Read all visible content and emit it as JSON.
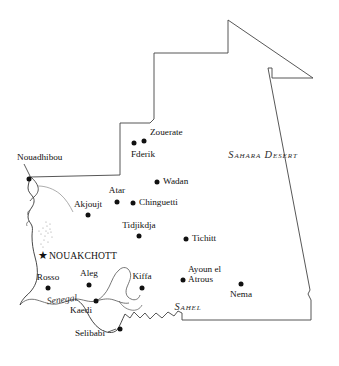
{
  "map": {
    "title": "Mauritania",
    "colors": {
      "border": "#444444",
      "coast": "#333333",
      "river": "#555555",
      "marker": "#111111",
      "background": "#ffffff"
    },
    "capital": {
      "name": "NOUAKCHOTT",
      "marker": "star-marker",
      "marker_glyph": "★",
      "dot_x": 43,
      "dot_y": 255,
      "label_x": 49,
      "label_y": 255
    },
    "cities": [
      {
        "name": "Zouerate",
        "dot_x": 144,
        "dot_y": 141,
        "label_x": 150,
        "label_y": 133,
        "anchor": "anchor-left"
      },
      {
        "name": "Fderik",
        "dot_x": 134,
        "dot_y": 143,
        "label_x": 131,
        "label_y": 155,
        "anchor": "anchor-left"
      },
      {
        "name": "Wadan",
        "dot_x": 157,
        "dot_y": 182,
        "label_x": 163,
        "label_y": 182,
        "anchor": "anchor-left"
      },
      {
        "name": "Atar",
        "dot_x": 117,
        "dot_y": 202,
        "label_x": 117,
        "label_y": 191,
        "anchor": "anchor-mid"
      },
      {
        "name": "Chinguetti",
        "dot_x": 133,
        "dot_y": 203,
        "label_x": 139,
        "label_y": 203,
        "anchor": "anchor-left"
      },
      {
        "name": "Akjoujt",
        "dot_x": 88,
        "dot_y": 215,
        "label_x": 88,
        "label_y": 205,
        "anchor": "anchor-mid"
      },
      {
        "name": "Tidjikdja",
        "dot_x": 139,
        "dot_y": 236,
        "label_x": 139,
        "label_y": 226,
        "anchor": "anchor-mid"
      },
      {
        "name": "Tichitt",
        "dot_x": 186,
        "dot_y": 239,
        "label_x": 192,
        "label_y": 239,
        "anchor": "anchor-left"
      },
      {
        "name": "Rosso",
        "dot_x": 48,
        "dot_y": 288,
        "label_x": 48,
        "label_y": 278,
        "anchor": "anchor-mid"
      },
      {
        "name": "Aleg",
        "dot_x": 89,
        "dot_y": 285,
        "label_x": 89,
        "label_y": 274,
        "anchor": "anchor-mid"
      },
      {
        "name": "Kiffa",
        "dot_x": 142,
        "dot_y": 288,
        "label_x": 142,
        "label_y": 277,
        "anchor": "anchor-mid"
      },
      {
        "name": "Nema",
        "dot_x": 241,
        "dot_y": 284,
        "label_x": 241,
        "label_y": 295,
        "anchor": "anchor-mid"
      },
      {
        "name": "Kaedi",
        "dot_x": 96,
        "dot_y": 301,
        "label_x": 92,
        "label_y": 311,
        "anchor": "anchor-right"
      },
      {
        "name": "Selibabi",
        "dot_x": 120,
        "dot_y": 329,
        "label_x": 105,
        "label_y": 334,
        "anchor": "anchor-right"
      }
    ],
    "cities_multiline": [
      {
        "name": "Ayoun el Atrous",
        "line1": "Ayoun el",
        "line2": "Atrous",
        "dot_x": 183,
        "dot_y": 280,
        "label_x": 188,
        "label_y": 275
      }
    ],
    "cities_with_leader": [
      {
        "name": "Nouadhibou",
        "dot_x": 29,
        "dot_y": 179,
        "label_x": 17,
        "label_y": 158,
        "anchor": "anchor-left",
        "leader": "M 24 164 L 30 176"
      }
    ],
    "selibabi_leader": "M 108 332 L 116 329",
    "region_labels": [
      {
        "name": "Sahara Desert",
        "text": "Sahara Desert",
        "x": 263,
        "y": 154
      },
      {
        "name": "Sahel",
        "text": "Sahel",
        "x": 188,
        "y": 306
      }
    ],
    "river_labels": [
      {
        "name": "Senegal",
        "text": "Senegal",
        "x": 62,
        "y": 299
      }
    ]
  }
}
